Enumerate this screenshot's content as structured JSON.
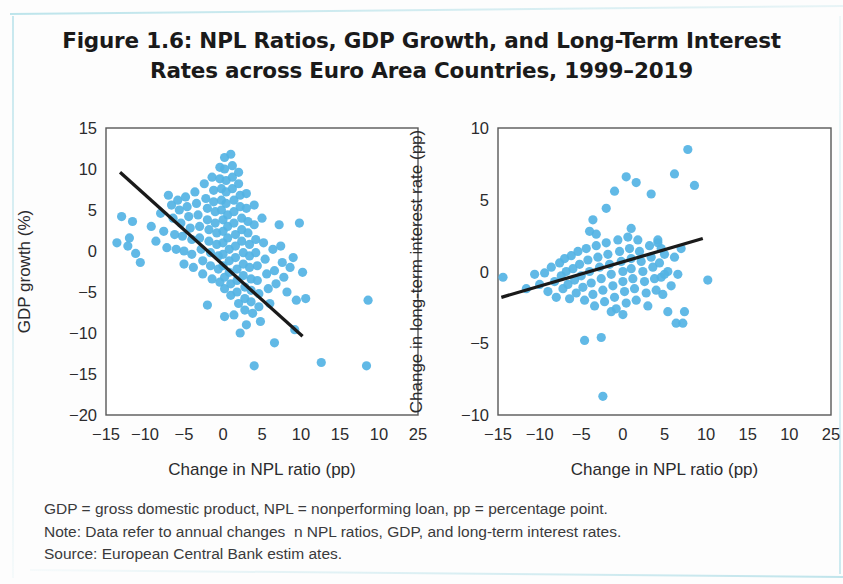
{
  "title": {
    "line1": "Figure 1.6: NPL Ratios, GDP Growth, and Long-Term Interest",
    "line2": "Rates across Euro Area Countries, 1999–2019"
  },
  "notes": {
    "line1": "GDP = gross domestic product, NPL = nonperforming loan, pp = percentage point.",
    "line2": "Note: Data refer to annual changes  n NPL ratios, GDP, and long-term interest rates.",
    "line3": "Source: European Central Bank estim ates."
  },
  "colors": {
    "marker": "#54b3e4",
    "trendline": "#1a1a1a",
    "frame": "#585858",
    "text": "#2b2b2d",
    "background": "#fdfdfd"
  },
  "chart_data": [
    {
      "type": "scatter",
      "title": "GDP growth vs change in NPL ratio",
      "xlabel": "Change in NPL ratio (pp)",
      "ylabel": "GDP growth (%)",
      "xlim": [
        -15,
        25
      ],
      "ylim": [
        -20,
        15
      ],
      "xticks": [
        -15,
        -10,
        -5,
        0,
        5,
        10,
        15,
        10,
        25
      ],
      "xtick_values": [
        -15,
        -10,
        -5,
        0,
        5,
        10,
        15,
        20,
        25
      ],
      "yticks": [
        15,
        10,
        5,
        0,
        -5,
        -10,
        -15,
        -20
      ],
      "grid": false,
      "legend": null,
      "trendline": {
        "x": [
          -13.2,
          10.2
        ],
        "y": [
          9.6,
          -10.4
        ],
        "label": "linear fit (negative slope)"
      },
      "points": [
        [
          -11.6,
          3.6
        ],
        [
          -12.0,
          1.6
        ],
        [
          -12.2,
          0.6
        ],
        [
          -11.2,
          -0.3
        ],
        [
          -10.6,
          -1.4
        ],
        [
          -9.2,
          3.0
        ],
        [
          -8.6,
          1.2
        ],
        [
          -8.0,
          4.6
        ],
        [
          -7.6,
          2.4
        ],
        [
          -7.2,
          0.4
        ],
        [
          -7.0,
          6.8
        ],
        [
          -6.6,
          5.6
        ],
        [
          -6.4,
          4.0
        ],
        [
          -6.2,
          2.0
        ],
        [
          -6.0,
          0.2
        ],
        [
          -5.8,
          6.2
        ],
        [
          -5.6,
          5.0
        ],
        [
          -5.4,
          3.4
        ],
        [
          -5.2,
          1.8
        ],
        [
          -5.0,
          0.0
        ],
        [
          -5.0,
          -1.6
        ],
        [
          -4.8,
          6.6
        ],
        [
          -4.6,
          5.4
        ],
        [
          -4.4,
          4.2
        ],
        [
          -4.2,
          2.8
        ],
        [
          -4.0,
          1.4
        ],
        [
          -4.0,
          -0.4
        ],
        [
          -3.8,
          -2.0
        ],
        [
          -3.6,
          7.2
        ],
        [
          -3.4,
          5.8
        ],
        [
          -3.2,
          4.4
        ],
        [
          -3.0,
          3.0
        ],
        [
          -3.0,
          1.6
        ],
        [
          -2.8,
          0.2
        ],
        [
          -2.6,
          -1.2
        ],
        [
          -2.6,
          -2.8
        ],
        [
          -2.4,
          8.2
        ],
        [
          -2.2,
          6.4
        ],
        [
          -2.0,
          5.2
        ],
        [
          -2.0,
          3.8
        ],
        [
          -1.8,
          2.6
        ],
        [
          -1.8,
          1.2
        ],
        [
          -1.6,
          -0.2
        ],
        [
          -1.6,
          -1.8
        ],
        [
          -1.4,
          -3.4
        ],
        [
          -1.4,
          9.0
        ],
        [
          -1.2,
          7.4
        ],
        [
          -1.2,
          6.0
        ],
        [
          -1.0,
          4.8
        ],
        [
          -1.0,
          3.4
        ],
        [
          -0.8,
          2.2
        ],
        [
          -0.8,
          0.8
        ],
        [
          -0.6,
          -0.6
        ],
        [
          -0.6,
          -2.2
        ],
        [
          -0.4,
          -3.8
        ],
        [
          -0.4,
          10.2
        ],
        [
          -0.4,
          8.8
        ],
        [
          -0.2,
          7.6
        ],
        [
          -0.2,
          6.2
        ],
        [
          -0.2,
          5.0
        ],
        [
          0.0,
          3.8
        ],
        [
          0.0,
          2.4
        ],
        [
          0.0,
          1.0
        ],
        [
          0.0,
          -0.4
        ],
        [
          0.0,
          -1.8
        ],
        [
          0.2,
          -3.2
        ],
        [
          0.2,
          -4.6
        ],
        [
          0.2,
          11.4
        ],
        [
          0.2,
          10.0
        ],
        [
          0.4,
          8.6
        ],
        [
          0.4,
          7.2
        ],
        [
          0.4,
          5.8
        ],
        [
          0.6,
          4.4
        ],
        [
          0.6,
          3.0
        ],
        [
          0.6,
          1.6
        ],
        [
          0.8,
          0.2
        ],
        [
          0.8,
          -1.2
        ],
        [
          0.8,
          -2.6
        ],
        [
          1.0,
          -4.0
        ],
        [
          1.0,
          -5.4
        ],
        [
          1.0,
          11.8
        ],
        [
          1.2,
          10.4
        ],
        [
          1.2,
          9.0
        ],
        [
          1.2,
          7.6
        ],
        [
          1.4,
          6.2
        ],
        [
          1.4,
          4.8
        ],
        [
          1.4,
          3.4
        ],
        [
          1.6,
          2.0
        ],
        [
          1.6,
          0.6
        ],
        [
          1.6,
          -0.8
        ],
        [
          1.8,
          -2.2
        ],
        [
          1.8,
          -3.6
        ],
        [
          1.8,
          -5.0
        ],
        [
          2.0,
          -6.4
        ],
        [
          2.0,
          9.6
        ],
        [
          2.0,
          8.2
        ],
        [
          2.2,
          6.8
        ],
        [
          2.2,
          5.4
        ],
        [
          2.4,
          4.0
        ],
        [
          2.4,
          2.6
        ],
        [
          2.4,
          1.2
        ],
        [
          2.6,
          -0.2
        ],
        [
          2.6,
          -1.6
        ],
        [
          2.6,
          -3.0
        ],
        [
          2.8,
          -4.4
        ],
        [
          2.8,
          -5.8
        ],
        [
          2.8,
          -7.2
        ],
        [
          3.0,
          7.0
        ],
        [
          3.0,
          5.2
        ],
        [
          3.2,
          3.6
        ],
        [
          3.2,
          2.2
        ],
        [
          3.4,
          0.8
        ],
        [
          3.4,
          -0.6
        ],
        [
          3.4,
          -2.0
        ],
        [
          3.6,
          -3.4
        ],
        [
          3.6,
          -4.8
        ],
        [
          3.6,
          -6.2
        ],
        [
          3.8,
          -7.6
        ],
        [
          4.0,
          5.6
        ],
        [
          4.0,
          3.2
        ],
        [
          4.2,
          1.4
        ],
        [
          4.2,
          -0.2
        ],
        [
          4.4,
          -1.8
        ],
        [
          4.4,
          -3.6
        ],
        [
          4.6,
          -5.2
        ],
        [
          4.6,
          -6.8
        ],
        [
          4.8,
          -8.6
        ],
        [
          5.0,
          4.0
        ],
        [
          5.2,
          1.0
        ],
        [
          5.4,
          -1.0
        ],
        [
          5.6,
          -2.8
        ],
        [
          5.8,
          -4.6
        ],
        [
          6.0,
          -6.4
        ],
        [
          6.4,
          0.2
        ],
        [
          6.6,
          -2.4
        ],
        [
          6.8,
          -4.0
        ],
        [
          7.2,
          3.2
        ],
        [
          7.4,
          0.6
        ],
        [
          7.6,
          -1.4
        ],
        [
          7.8,
          -3.2
        ],
        [
          8.2,
          -5.0
        ],
        [
          8.6,
          -2.0
        ],
        [
          9.0,
          -0.8
        ],
        [
          9.4,
          -6.0
        ],
        [
          9.8,
          3.4
        ],
        [
          10.2,
          -2.6
        ],
        [
          10.6,
          -5.8
        ],
        [
          4.0,
          -14.0
        ],
        [
          12.6,
          -13.6
        ],
        [
          18.4,
          -14.0
        ],
        [
          9.2,
          -9.6
        ],
        [
          6.6,
          -11.2
        ],
        [
          18.6,
          -6.0
        ],
        [
          -13.0,
          4.2
        ],
        [
          -13.6,
          1.0
        ],
        [
          2.2,
          -10.0
        ],
        [
          0.2,
          -8.0
        ],
        [
          -2.0,
          -6.6
        ],
        [
          1.4,
          -7.8
        ],
        [
          3.0,
          -9.0
        ]
      ]
    },
    {
      "type": "scatter",
      "title": "Change in long-term interest rate vs change in NPL ratio",
      "xlabel": "Change in NPL ratio (pp)",
      "ylabel": "Change in long-term interest rate (pp)",
      "xlim": [
        -15,
        25
      ],
      "ylim": [
        -10,
        10
      ],
      "xticks": [
        -15,
        -10,
        -5,
        0,
        5,
        10,
        15,
        10,
        25
      ],
      "xtick_values": [
        -15,
        -10,
        -5,
        0,
        5,
        10,
        15,
        20,
        25
      ],
      "yticks": [
        10,
        5,
        0,
        -5,
        -10
      ],
      "grid": false,
      "legend": null,
      "trendline": {
        "x": [
          -14.6,
          9.6
        ],
        "y": [
          -1.8,
          2.3
        ],
        "label": "linear fit (positive slope)"
      },
      "points": [
        [
          -14.4,
          -0.4
        ],
        [
          -11.6,
          -1.2
        ],
        [
          -10.6,
          -0.2
        ],
        [
          -10.0,
          -0.9
        ],
        [
          -9.4,
          -0.1
        ],
        [
          -9.0,
          -1.4
        ],
        [
          -8.6,
          0.3
        ],
        [
          -8.2,
          -0.7
        ],
        [
          -8.0,
          -1.8
        ],
        [
          -7.6,
          0.6
        ],
        [
          -7.4,
          -0.3
        ],
        [
          -7.2,
          -1.2
        ],
        [
          -7.0,
          0.9
        ],
        [
          -6.8,
          0.0
        ],
        [
          -6.6,
          -0.9
        ],
        [
          -6.4,
          -1.9
        ],
        [
          -6.2,
          1.1
        ],
        [
          -6.0,
          0.2
        ],
        [
          -5.8,
          -0.6
        ],
        [
          -5.6,
          -1.5
        ],
        [
          -5.4,
          1.4
        ],
        [
          -5.2,
          0.5
        ],
        [
          -5.0,
          -0.3
        ],
        [
          -4.8,
          -1.1
        ],
        [
          -4.6,
          -2.0
        ],
        [
          -4.4,
          1.6
        ],
        [
          -4.2,
          0.8
        ],
        [
          -4.0,
          0.0
        ],
        [
          -3.8,
          -0.8
        ],
        [
          -3.6,
          -1.6
        ],
        [
          -3.4,
          -2.4
        ],
        [
          -3.2,
          1.8
        ],
        [
          -3.0,
          1.0
        ],
        [
          -2.8,
          0.3
        ],
        [
          -2.6,
          -0.5
        ],
        [
          -2.4,
          -1.3
        ],
        [
          -2.2,
          -2.1
        ],
        [
          -2.0,
          2.0
        ],
        [
          -1.8,
          1.2
        ],
        [
          -1.6,
          0.5
        ],
        [
          -1.4,
          -0.2
        ],
        [
          -1.2,
          -1.0
        ],
        [
          -1.0,
          -1.8
        ],
        [
          -0.8,
          -2.6
        ],
        [
          -0.6,
          2.2
        ],
        [
          -0.4,
          1.4
        ],
        [
          -0.2,
          0.7
        ],
        [
          0.0,
          0.0
        ],
        [
          0.0,
          -0.7
        ],
        [
          0.2,
          -1.4
        ],
        [
          0.4,
          -2.2
        ],
        [
          0.6,
          2.4
        ],
        [
          0.8,
          1.6
        ],
        [
          1.0,
          0.9
        ],
        [
          1.0,
          0.2
        ],
        [
          1.2,
          -0.5
        ],
        [
          1.4,
          -1.2
        ],
        [
          1.6,
          -2.0
        ],
        [
          1.8,
          2.2
        ],
        [
          2.0,
          1.4
        ],
        [
          2.2,
          0.7
        ],
        [
          2.4,
          0.0
        ],
        [
          2.6,
          -0.7
        ],
        [
          2.8,
          -1.5
        ],
        [
          3.0,
          -2.4
        ],
        [
          3.2,
          1.8
        ],
        [
          3.4,
          1.0
        ],
        [
          3.6,
          0.3
        ],
        [
          3.8,
          -0.5
        ],
        [
          4.0,
          -1.3
        ],
        [
          4.2,
          2.0
        ],
        [
          4.4,
          0.6
        ],
        [
          4.6,
          -0.4
        ],
        [
          4.8,
          -1.6
        ],
        [
          5.0,
          1.2
        ],
        [
          5.4,
          0.0
        ],
        [
          5.8,
          -1.0
        ],
        [
          6.2,
          1.0
        ],
        [
          6.6,
          -0.2
        ],
        [
          7.0,
          1.6
        ],
        [
          -3.6,
          3.6
        ],
        [
          -4.0,
          2.8
        ],
        [
          -3.2,
          2.6
        ],
        [
          -2.0,
          4.4
        ],
        [
          -1.0,
          5.6
        ],
        [
          0.4,
          6.6
        ],
        [
          1.6,
          6.2
        ],
        [
          3.4,
          5.4
        ],
        [
          7.8,
          8.5
        ],
        [
          1.0,
          3.0
        ],
        [
          4.2,
          2.2
        ],
        [
          6.2,
          6.8
        ],
        [
          8.6,
          6.0
        ],
        [
          5.4,
          -2.8
        ],
        [
          7.4,
          -2.8
        ],
        [
          6.4,
          -3.6
        ],
        [
          7.2,
          -3.6
        ],
        [
          -4.6,
          -4.8
        ],
        [
          -2.6,
          -4.6
        ],
        [
          10.2,
          -0.6
        ],
        [
          -2.4,
          -8.7
        ],
        [
          5.0,
          -0.2
        ],
        [
          4.6,
          1.6
        ],
        [
          0.0,
          -3.0
        ],
        [
          -1.4,
          -2.8
        ]
      ]
    }
  ]
}
